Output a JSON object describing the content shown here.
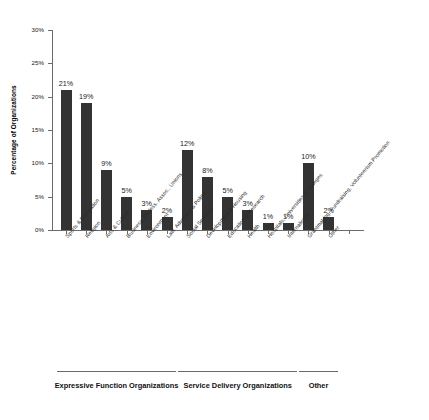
{
  "chart_data": {
    "type": "bar",
    "title": "",
    "subtitle": "",
    "xlabel": "",
    "ylabel": "Percentage of Organizations",
    "ylim": [
      0,
      30
    ],
    "yticks": [
      "0%",
      "5%",
      "10%",
      "15%",
      "20%",
      "25%",
      "30%"
    ],
    "ytick_values": [
      0,
      5,
      10,
      15,
      20,
      25,
      30
    ],
    "grid": false,
    "legend_position": "below-plot",
    "bar_color": "#333333",
    "axis_color": "#6b6b6b",
    "categories": [
      "Sports & Recreation",
      "Religion",
      "Arts & Culture",
      "Business, Profess. Assoc., Unions",
      "Environment",
      "Law, Advocacy & Politics",
      "Social Services",
      "Development & Housing",
      "Education & Research",
      "Health",
      "Hospitals, Universities & Colleges",
      "International",
      "Grantmaking, Fundraising, Volunteerism Promotion",
      "Other"
    ],
    "values": [
      21,
      19,
      9,
      5,
      3,
      2,
      12,
      8,
      5,
      3,
      1,
      1,
      10,
      2
    ],
    "value_labels": [
      "21%",
      "19%",
      "9%",
      "5%",
      "3%",
      "2%",
      "12%",
      "8%",
      "5%",
      "3%",
      "1%",
      "1%",
      "10%",
      "2%"
    ],
    "annotations": [
      {
        "label": "Expressive Function Organizations",
        "span_categories": [
          0,
          5
        ]
      },
      {
        "label": "Service Delivery Organizations",
        "span_categories": [
          6,
          11
        ]
      },
      {
        "label": "Other",
        "span_categories": [
          12,
          13
        ]
      }
    ]
  }
}
